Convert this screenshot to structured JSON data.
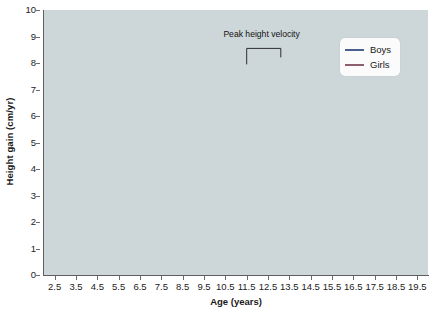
{
  "chart_data": {
    "type": "line",
    "title": "",
    "xlabel": "Age (years)",
    "ylabel": "Height gain (cm/yr)",
    "xlim": [
      2.0,
      20.0
    ],
    "ylim": [
      0,
      10
    ],
    "grid": true,
    "legend_position": "top-right",
    "xticks": [
      "2.5",
      "3.5",
      "4.5",
      "5.5",
      "6.5",
      "7.5",
      "8.5",
      "9.5",
      "10.5",
      "11.5",
      "12.5",
      "13.5",
      "14.5",
      "15.5",
      "16.5",
      "17.5",
      "18.5",
      "19.5"
    ],
    "xtick_values": [
      2.5,
      3.5,
      4.5,
      5.5,
      6.5,
      7.5,
      8.5,
      9.5,
      10.5,
      11.5,
      12.5,
      13.5,
      14.5,
      15.5,
      16.5,
      17.5,
      18.5,
      19.5
    ],
    "yticks": [
      "0",
      "1",
      "2",
      "3",
      "4",
      "5",
      "6",
      "7",
      "8",
      "9",
      "10"
    ],
    "ytick_values": [
      0,
      1,
      2,
      3,
      4,
      5,
      6,
      7,
      8,
      9,
      10
    ],
    "annotations": [
      {
        "text": "Peak height velocity",
        "x": 12.2,
        "y": 9.1,
        "bracket_from_x": 11.5,
        "bracket_to_x": 13.1,
        "bracket_y": 8.55
      }
    ],
    "series": [
      {
        "name": "Boys",
        "color": "#4b5f8f",
        "x": [
          2.5,
          3.0,
          3.5,
          4.0,
          4.5,
          5.0,
          5.5,
          6.0,
          6.5,
          7.0,
          7.5,
          8.0,
          8.5,
          9.0,
          9.5,
          10.0,
          10.5,
          11.0,
          11.3,
          11.6,
          12.0,
          12.4,
          12.8,
          13.0,
          13.3,
          13.6,
          14.0,
          14.5,
          15.0,
          15.5,
          16.0,
          16.5,
          17.0,
          17.5
        ],
        "y": [
          8.9,
          8.0,
          7.25,
          6.95,
          6.8,
          6.7,
          6.6,
          6.52,
          6.45,
          6.3,
          6.1,
          5.9,
          5.7,
          5.5,
          5.35,
          5.22,
          5.15,
          5.3,
          5.6,
          6.2,
          7.1,
          7.6,
          7.78,
          7.8,
          7.7,
          7.45,
          6.9,
          6.0,
          4.9,
          3.8,
          2.85,
          2.1,
          1.5,
          1.15
        ]
      },
      {
        "name": "Girls",
        "color": "#8d5e6e",
        "x": [
          2.5,
          3.0,
          3.5,
          4.0,
          4.5,
          5.0,
          5.5,
          6.0,
          6.5,
          7.0,
          7.5,
          8.0,
          8.5,
          9.0,
          9.5,
          10.0,
          10.3,
          10.6,
          11.0,
          11.3,
          11.5,
          11.8,
          12.1,
          12.5,
          13.0,
          13.5,
          14.0,
          14.5,
          15.0,
          15.5
        ],
        "y": [
          8.5,
          7.85,
          7.2,
          6.92,
          6.75,
          6.65,
          6.55,
          6.5,
          6.48,
          6.35,
          6.2,
          6.0,
          5.8,
          5.6,
          5.45,
          5.4,
          5.5,
          5.9,
          6.7,
          7.15,
          7.2,
          7.05,
          6.6,
          5.8,
          4.75,
          3.9,
          3.1,
          2.5,
          1.7,
          1.0
        ]
      }
    ]
  },
  "legend": {
    "items": [
      {
        "label": "Boys",
        "color": "#4b5f8f"
      },
      {
        "label": "Girls",
        "color": "#8d5e6e"
      }
    ]
  }
}
